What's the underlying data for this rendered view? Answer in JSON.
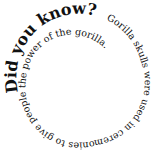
{
  "spiral": {
    "heading": "Did you know?",
    "body": "Gorilla skulls were used in ceremonies to give people the power of the gorilla."
  },
  "colors": {
    "text": "#111111",
    "background": "#ffffff"
  }
}
